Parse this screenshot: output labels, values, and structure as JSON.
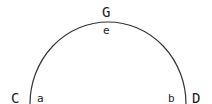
{
  "diagram": {
    "type": "semicircular-arc",
    "stroke_color": "#333333",
    "arc": {
      "start_point": "C",
      "top_point": "G",
      "end_point": "D"
    },
    "labels": {
      "left_end": "C",
      "left_inner": "a",
      "top_outer": "G",
      "top_inner": "e",
      "right_inner": "b",
      "right_end": "D"
    }
  }
}
